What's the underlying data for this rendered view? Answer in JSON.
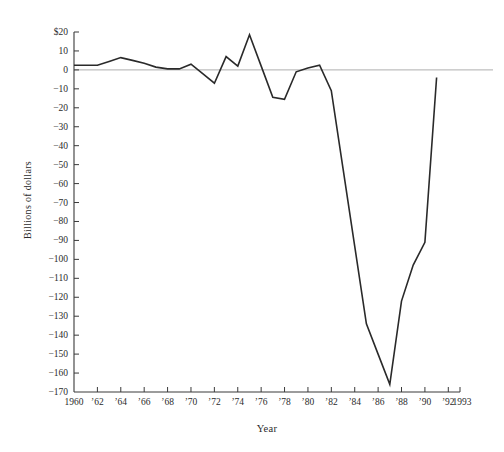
{
  "figure": {
    "background": "#ffffff",
    "colors": {
      "line": "#2a2a2a",
      "axis": "#3a3a3a",
      "tick": "#3a3a3a",
      "zero_line": "#9a9a9a",
      "text": "#2b2b2b"
    }
  },
  "chart_data": {
    "type": "line",
    "title": "",
    "xlabel": "Year",
    "ylabel": "Billions of dollars",
    "xlim": [
      1960,
      1993
    ],
    "ylim": [
      -170,
      20
    ],
    "grid": "off",
    "legend": "none",
    "zero_line": true,
    "x": [
      1960,
      1961,
      1962,
      1963,
      1964,
      1965,
      1966,
      1967,
      1968,
      1969,
      1970,
      1971,
      1972,
      1973,
      1974,
      1975,
      1976,
      1977,
      1978,
      1979,
      1980,
      1981,
      1982,
      1983,
      1984,
      1985,
      1986,
      1987,
      1988,
      1989,
      1990,
      1991
    ],
    "values": [
      2.5,
      2.5,
      2.5,
      4.5,
      6.5,
      5,
      3.5,
      1.5,
      0.5,
      0.5,
      3,
      -2,
      -7,
      7,
      2,
      18.5,
      2,
      -14.5,
      -15.5,
      -1,
      1,
      2.5,
      -11,
      -52,
      -93,
      -134,
      -150,
      -166,
      -122,
      -103,
      -91,
      -4
    ],
    "series_name": "Balance, billions of dollars",
    "x_ticks": [
      {
        "year": 1960,
        "label": "1960",
        "tick": false
      },
      {
        "year": 1962,
        "label": "’62",
        "tick": true
      },
      {
        "year": 1964,
        "label": "’64",
        "tick": true
      },
      {
        "year": 1966,
        "label": "’66",
        "tick": true
      },
      {
        "year": 1968,
        "label": "’68",
        "tick": true
      },
      {
        "year": 1970,
        "label": "’70",
        "tick": true
      },
      {
        "year": 1972,
        "label": "’72",
        "tick": true
      },
      {
        "year": 1974,
        "label": "’74",
        "tick": true
      },
      {
        "year": 1976,
        "label": "’76",
        "tick": true
      },
      {
        "year": 1978,
        "label": "’78",
        "tick": true
      },
      {
        "year": 1980,
        "label": "’80",
        "tick": true
      },
      {
        "year": 1982,
        "label": "’82",
        "tick": true
      },
      {
        "year": 1984,
        "label": "’84",
        "tick": true
      },
      {
        "year": 1986,
        "label": "’86",
        "tick": true
      },
      {
        "year": 1988,
        "label": "’88",
        "tick": true
      },
      {
        "year": 1990,
        "label": "’90",
        "tick": true
      },
      {
        "year": 1992,
        "label": "’92",
        "tick": true
      },
      {
        "year": 1993,
        "label": "1993",
        "tick": true
      }
    ],
    "y_ticks": [
      {
        "value": 20,
        "label": "$20"
      },
      {
        "value": 10,
        "label": "10"
      },
      {
        "value": 0,
        "label": "0"
      },
      {
        "value": -10,
        "label": "−10"
      },
      {
        "value": -20,
        "label": "−20"
      },
      {
        "value": -30,
        "label": "−30"
      },
      {
        "value": -40,
        "label": "−40"
      },
      {
        "value": -50,
        "label": "−50"
      },
      {
        "value": -60,
        "label": "−60"
      },
      {
        "value": -70,
        "label": "−70"
      },
      {
        "value": -80,
        "label": "−80"
      },
      {
        "value": -90,
        "label": "−90"
      },
      {
        "value": -100,
        "label": "−100"
      },
      {
        "value": -110,
        "label": "−110"
      },
      {
        "value": -120,
        "label": "−120"
      },
      {
        "value": -130,
        "label": "−130"
      },
      {
        "value": -140,
        "label": "−140"
      },
      {
        "value": -150,
        "label": "−150"
      },
      {
        "value": -160,
        "label": "−160"
      },
      {
        "value": -170,
        "label": "−170"
      }
    ]
  }
}
